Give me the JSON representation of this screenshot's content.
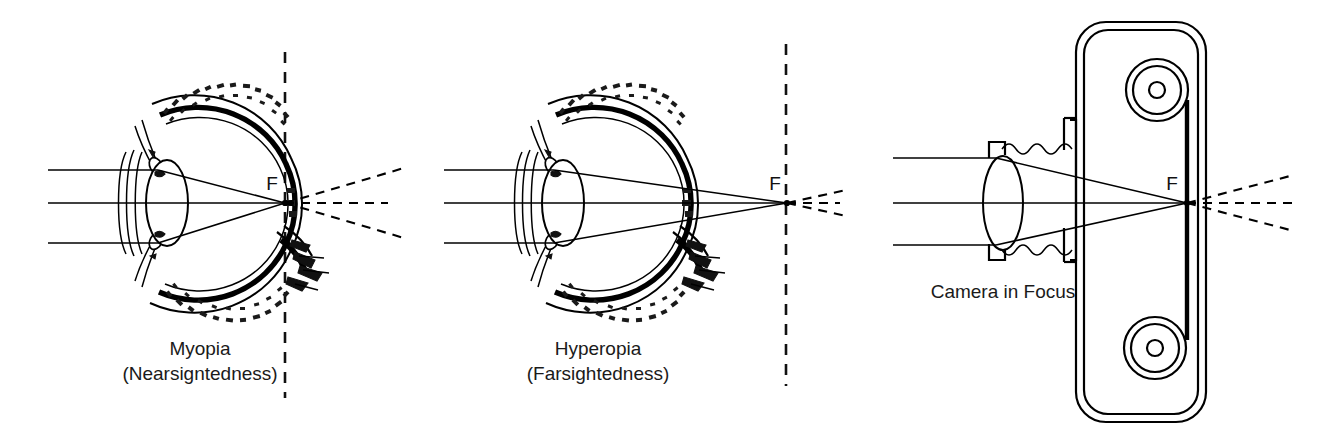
{
  "figure": {
    "background_color": "#ffffff",
    "ink_color": "#000000",
    "width": 1336,
    "height": 439
  },
  "panels": [
    {
      "id": "myopia",
      "label_line1": "Myopia",
      "label_line2": "(Nearsigntedness)",
      "focal_letter": "F",
      "focal_note": "focal point falls in front of the retina, inside the vitreous chamber",
      "ray_count": 3,
      "label_x": 200,
      "label_y1": 355,
      "label_y2": 380,
      "focal_letter_x": 272,
      "focal_letter_y": 190,
      "focal_point_x": 285,
      "focal_point_y": 203
    },
    {
      "id": "hyperopia",
      "label_line1": "Hyperopia",
      "label_line2": "(Farsightedness)",
      "focal_letter": "F",
      "focal_note": "focal point falls behind the retina, outside the eyeball",
      "ray_count": 3,
      "label_x": 598,
      "label_y1": 355,
      "label_y2": 380,
      "focal_letter_x": 776,
      "focal_letter_y": 190,
      "focal_point_x": 787,
      "focal_point_y": 203
    },
    {
      "id": "camera",
      "label_line1": "Camera in Focus",
      "label_line2": "",
      "focal_letter": "F",
      "focal_note": "focal point falls exactly on the film plane",
      "ray_count": 3,
      "label_x": 1003,
      "label_y1": 298,
      "label_y2": 0,
      "focal_letter_x": 1172,
      "focal_letter_y": 190,
      "focal_point_x": 1187,
      "focal_point_y": 203
    }
  ],
  "dividers": [
    {
      "name": "divider-left",
      "x": 285,
      "y_top": 52,
      "y_bottom": 398
    },
    {
      "name": "divider-right",
      "x": 786,
      "y_top": 44,
      "y_bottom": 386
    }
  ],
  "optical_axis": {
    "y": 203,
    "note": "horizontal center ray through every lens"
  },
  "eye_parts": {
    "cornea": "cornea-arcs",
    "lens": "crystalline-lens",
    "retina": "retina-layer",
    "optic_nerve": "optic-nerve"
  },
  "camera_parts": {
    "body": "camera-body",
    "lens": "camera-lens",
    "bellows": "camera-bellows",
    "film_plane": "film-plane",
    "spool_top": "film-spool-top",
    "spool_bottom": "film-spool-bottom"
  }
}
